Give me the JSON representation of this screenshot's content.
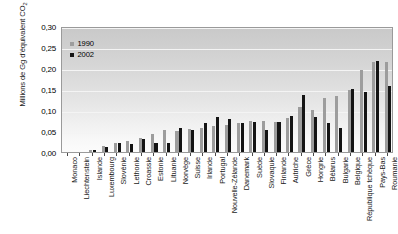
{
  "chart_data": {
    "type": "bar",
    "title": "",
    "subtitle": "",
    "xlabel": "",
    "ylabel": "Millions de Gg d'équivalent CO",
    "ylabel_sub": "2",
    "ylim": [
      0,
      0.3
    ],
    "ytick_values": [
      0.3,
      0.25,
      0.2,
      0.15,
      0.1,
      0.05,
      0.0
    ],
    "ytick_labels": [
      "0,30",
      "0,25",
      "0,20",
      "0,15",
      "0,10",
      "0,05",
      "0,00"
    ],
    "grid": true,
    "legend_position": "top-left",
    "legend": [
      "1990",
      "2002"
    ],
    "colors": {
      "series_1990": "#9d9d9d",
      "series_2002": "#141414",
      "plot_background_top": "#c9c9c9",
      "plot_background_bottom": "#fcfcfc",
      "gridline": "#f4f4f4",
      "frame": "#9a9a9a"
    },
    "categories": [
      "Monaco",
      "Liechtenstein",
      "Islande",
      "Luxembourg",
      "Slovénie",
      "Lethonie",
      "Croassie",
      "Estonie",
      "Lituanie",
      "Norvège",
      "Suisse",
      "Irlande",
      "Portugal",
      "Nouvelle-Zélande",
      "Danemark",
      "Suède",
      "Slovaquie",
      "Finlande",
      "Autriche",
      "Grèce",
      "Hongrie",
      "Bélarus",
      "Bulgarie",
      "Belgique",
      "République tchèque",
      "Pays-Bas",
      "Roumanie"
    ],
    "series": [
      {
        "name": "1990",
        "color": "#9d9d9d",
        "values": [
          0.0,
          0.0,
          0.003,
          0.013,
          0.02,
          0.026,
          0.031,
          0.042,
          0.051,
          0.05,
          0.053,
          0.055,
          0.06,
          0.062,
          0.069,
          0.072,
          0.072,
          0.071,
          0.079,
          0.105,
          0.098,
          0.127,
          0.133,
          0.146,
          0.193,
          0.214,
          0.212
        ]
      },
      {
        "name": "2002",
        "color": "#141414",
        "values": [
          0.0,
          0.0,
          0.003,
          0.011,
          0.02,
          0.017,
          0.029,
          0.021,
          0.02,
          0.055,
          0.052,
          0.069,
          0.081,
          0.077,
          0.069,
          0.07,
          0.051,
          0.07,
          0.084,
          0.135,
          0.083,
          0.069,
          0.055,
          0.148,
          0.142,
          0.216,
          0.155
        ]
      }
    ]
  }
}
